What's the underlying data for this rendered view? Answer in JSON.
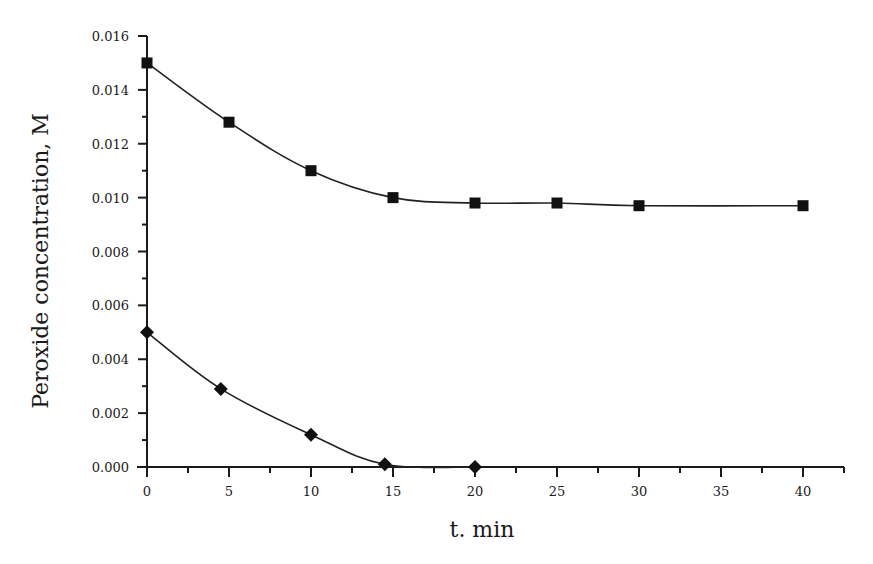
{
  "chart_data": {
    "type": "line",
    "title": "",
    "xlabel": "t. min",
    "ylabel": "Peroxide concentration, M",
    "xlim": [
      0,
      42.5
    ],
    "ylim": [
      0,
      0.016
    ],
    "grid": false,
    "legend": null,
    "x_ticks": [
      0,
      5,
      10,
      15,
      20,
      25,
      30,
      35,
      40
    ],
    "x_tick_labels": [
      "0",
      "5",
      "10",
      "15",
      "20",
      "25",
      "30",
      "35",
      "40"
    ],
    "x_minor_ticks": [
      2.5,
      7.5,
      12.5,
      17.5,
      22.5,
      27.5,
      32.5,
      37.5,
      42.5
    ],
    "y_ticks": [
      0,
      0.002,
      0.004,
      0.006,
      0.008,
      0.01,
      0.012,
      0.014,
      0.016
    ],
    "y_tick_labels": [
      "0.000",
      "0.002",
      "0.004",
      "0.006",
      "0.008",
      "0.010",
      "0.012",
      "0.014",
      "0.016"
    ],
    "y_minor_ticks": [
      0.001,
      0.003,
      0.005,
      0.007,
      0.009,
      0.011,
      0.013,
      0.015
    ],
    "series": [
      {
        "name": "upper series (squares)",
        "marker": "square",
        "x": [
          0,
          5,
          10,
          15,
          20,
          25,
          30,
          40
        ],
        "values": [
          0.015,
          0.0128,
          0.011,
          0.01,
          0.0098,
          0.0098,
          0.0097,
          0.0097
        ]
      },
      {
        "name": "lower series (diamonds)",
        "marker": "diamond",
        "x": [
          0,
          4.5,
          10,
          14.5,
          20
        ],
        "values": [
          0.005,
          0.0029,
          0.0012,
          0.0001,
          0.0
        ]
      }
    ]
  },
  "layout": {
    "plot_left": 147,
    "plot_bottom": 467,
    "px_per_x": 16.4,
    "px_per_y": 26937.5,
    "x_axis_end": 844,
    "y_axis_top": 36,
    "colors": {
      "ink": "#1a1a1a",
      "background": "#ffffff"
    }
  }
}
